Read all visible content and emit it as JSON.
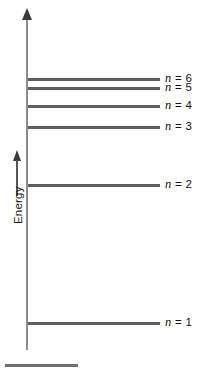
{
  "figure": {
    "type": "energy-level-diagram",
    "width": 204,
    "height": 373,
    "background": "#ffffff"
  },
  "axis": {
    "name": "Energy",
    "label": "Energy",
    "direction": "up",
    "color": "#8c8c8c",
    "arrow_color": "#3a3a3a"
  },
  "levels": [
    {
      "id": "n6",
      "n": 6,
      "label_n": "n",
      "label_eq": "= 6",
      "label": "n = 6",
      "y": 78,
      "bar_left": 28,
      "bar_width": 132,
      "label_x": 165
    },
    {
      "id": "n5",
      "n": 5,
      "label_n": "n",
      "label_eq": "= 5",
      "label": "n = 5",
      "y": 87,
      "bar_left": 28,
      "bar_width": 132,
      "label_x": 165
    },
    {
      "id": "n4",
      "n": 4,
      "label_n": "n",
      "label_eq": "= 4",
      "label": "n = 4",
      "y": 105,
      "bar_left": 28,
      "bar_width": 132,
      "label_x": 165
    },
    {
      "id": "n3",
      "n": 3,
      "label_n": "n",
      "label_eq": "= 3",
      "label": "n = 3",
      "y": 126,
      "bar_left": 28,
      "bar_width": 132,
      "label_x": 165
    },
    {
      "id": "n2",
      "n": 2,
      "label_n": "n",
      "label_eq": "= 2",
      "label": "n = 2",
      "y": 184,
      "bar_left": 28,
      "bar_width": 132,
      "label_x": 165
    },
    {
      "id": "n1",
      "n": 1,
      "label_n": "n",
      "label_eq": "= 1",
      "label": "n = 1",
      "y": 322,
      "bar_left": 28,
      "bar_width": 132,
      "label_x": 165
    }
  ],
  "colors": {
    "level_bar": "#5f5f5f",
    "axis": "#8c8c8c",
    "text": "#111111",
    "rule": "#707070"
  },
  "chart_data": {
    "type": "line",
    "title": "",
    "xlabel": "",
    "ylabel": "Energy",
    "categories": [
      "n = 1",
      "n = 2",
      "n = 3",
      "n = 4",
      "n = 5",
      "n = 6"
    ],
    "values": [
      322,
      184,
      126,
      105,
      87,
      78
    ],
    "value_meaning": "vertical pixel position of each level line (smaller = higher energy)",
    "grid": false,
    "legend": "none",
    "annotations": [
      "n = 6",
      "n = 5",
      "n = 4",
      "n = 3",
      "n = 2",
      "n = 1"
    ]
  }
}
